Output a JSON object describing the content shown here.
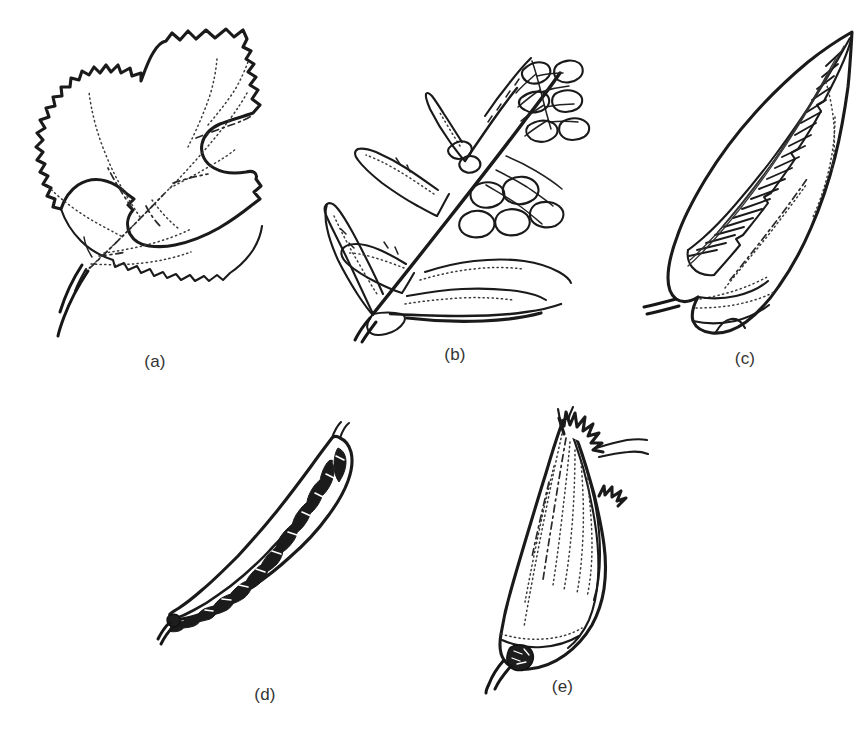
{
  "figure": {
    "background_color": "#ffffff",
    "ink_color": "#1a1a1a",
    "label_color": "#333333",
    "width": 866,
    "height": 740,
    "style": "black-and-white line drawing"
  },
  "panels": [
    {
      "id": "a",
      "label": "(a)",
      "subject": "leaf-with-marginal-notch-feeding",
      "description": "Serrate leaf blade with large smooth semicircular bites removed from the margin",
      "damage_type": "marginal notching / margin chewing",
      "label_x": 150,
      "label_y": 355
    },
    {
      "id": "b",
      "label": "(b)",
      "subject": "skeletonized-lobed-leaf",
      "description": "Lobed leaf reduced to a lace-like network of veins with tissue eaten between them",
      "damage_type": "skeletonization",
      "label_x": 447,
      "label_y": 355
    },
    {
      "id": "c",
      "label": "(c)",
      "subject": "folded-leaf-shelter-with-silk-stitching",
      "description": "Leaf folded over along the midrib and held shut by a ladder of silk strands",
      "damage_type": "leaf folding / tying",
      "label_x": 766,
      "label_y": 355
    },
    {
      "id": "d",
      "label": "(d)",
      "subject": "mined-narrow-leaf",
      "description": "Narrow elongate leaf filled with a dark blotchy serpentine mine",
      "damage_type": "leaf mining",
      "label_x": 258,
      "label_y": 706
    },
    {
      "id": "e",
      "label": "(e)",
      "subject": "rolled-leaf-shelter-with-exit-hole",
      "description": "Leaf rolled into a cone-shaped tube with a small dark exit hole near the base",
      "damage_type": "leaf rolling",
      "label_x": 560,
      "label_y": 706
    }
  ]
}
